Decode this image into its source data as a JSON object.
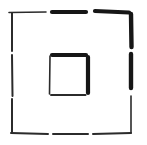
{
  "canvas": {
    "width": 147,
    "height": 145,
    "background": "#ffffff",
    "ink_color": "#161616",
    "thin_ink_color": "#2b2b2b"
  },
  "figure": {
    "outer_square": {
      "segments": [
        {
          "name": "outer-top-dash-1",
          "x1": 9,
          "y1": 12.5,
          "x2": 46,
          "y2": 12,
          "w": 1.6,
          "tone": "thin"
        },
        {
          "name": "outer-top-dash-2",
          "x1": 52,
          "y1": 12,
          "x2": 86,
          "y2": 12,
          "w": 4.2,
          "tone": "heavy"
        },
        {
          "name": "outer-top-dash-3",
          "x1": 95,
          "y1": 11,
          "x2": 129,
          "y2": 12.5,
          "w": 4.2,
          "tone": "heavy"
        },
        {
          "name": "outer-right-dash-1",
          "x1": 131,
          "y1": 14,
          "x2": 131.5,
          "y2": 47,
          "w": 4.4,
          "tone": "heavy"
        },
        {
          "name": "outer-right-dash-2",
          "x1": 131,
          "y1": 54,
          "x2": 131,
          "y2": 88,
          "w": 4.4,
          "tone": "heavy"
        },
        {
          "name": "outer-right-dash-3",
          "x1": 131,
          "y1": 96,
          "x2": 131,
          "y2": 133,
          "w": 1.6,
          "tone": "thin"
        },
        {
          "name": "outer-bottom-dash-1",
          "x1": 11,
          "y1": 133,
          "x2": 48,
          "y2": 134,
          "w": 2.0,
          "tone": "thin"
        },
        {
          "name": "outer-bottom-dash-2",
          "x1": 53,
          "y1": 134,
          "x2": 88,
          "y2": 134,
          "w": 2.0,
          "tone": "thin"
        },
        {
          "name": "outer-bottom-dash-3",
          "x1": 93,
          "y1": 134,
          "x2": 131,
          "y2": 133,
          "w": 2.0,
          "tone": "thin"
        },
        {
          "name": "outer-left-dash-1",
          "x1": 12,
          "y1": 13,
          "x2": 12,
          "y2": 51,
          "w": 2.0,
          "tone": "thin"
        },
        {
          "name": "outer-left-dash-2",
          "x1": 12,
          "y1": 55,
          "x2": 12.5,
          "y2": 96,
          "w": 2.0,
          "tone": "thin"
        },
        {
          "name": "outer-left-dash-3",
          "x1": 12,
          "y1": 99,
          "x2": 12,
          "y2": 132,
          "w": 2.0,
          "tone": "thin"
        }
      ]
    },
    "inner_square": {
      "segments": [
        {
          "name": "inner-top-edge",
          "x1": 52,
          "y1": 55,
          "x2": 86,
          "y2": 55,
          "w": 4.2,
          "tone": "heavy"
        },
        {
          "name": "inner-right-edge",
          "x1": 88,
          "y1": 57,
          "x2": 88,
          "y2": 93,
          "w": 4.2,
          "tone": "heavy"
        },
        {
          "name": "inner-bottom-edge",
          "x1": 51,
          "y1": 95,
          "x2": 85.5,
          "y2": 95,
          "w": 2.0,
          "tone": "thin"
        },
        {
          "name": "inner-left-edge",
          "x1": 50,
          "y1": 56,
          "x2": 49.5,
          "y2": 94,
          "w": 1.6,
          "tone": "thin"
        }
      ]
    }
  }
}
